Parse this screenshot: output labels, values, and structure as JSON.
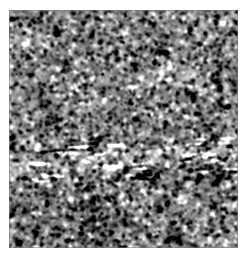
{
  "figure": {
    "kind": "grayscale-histopathology-micrograph",
    "title": "",
    "caption": "",
    "colorspace": "grayscale",
    "canvas": {
      "width_px": 247,
      "height_px": 258,
      "background_color": "#ffffff"
    },
    "panel": {
      "left_px": 9,
      "top_px": 10,
      "width_px": 229,
      "height_px": 238,
      "border_color": "#787878",
      "mean_gray": "#8d8d8d",
      "min_gray": "#0f0f0f",
      "max_gray": "#ffffff"
    },
    "texture": {
      "description": "dense cellular tissue, small dark nuclei on mid-gray cytoplasmic background",
      "nucleus_diameter_px": 3,
      "nucleus_color": "#1e1e1e",
      "highlight_color": "#f2f2f2",
      "background_color": "#8a8a8a",
      "grain_scale_px": 2,
      "seed": 20240517
    },
    "features": [
      {
        "name": "horizontal-stromal-band",
        "description": "lighter fibrous / vascular band crossing the field horizontally",
        "center_y_px": 148,
        "thickness_px": 26,
        "tilt_deg": -2,
        "brightness_delta": 26
      },
      {
        "name": "band-dark-rim",
        "description": "darker condensed margin along the upper edge of the band",
        "center_y_px": 134,
        "thickness_px": 7,
        "brightness_delta": -22
      },
      {
        "name": "dark-cell-cluster-lower-left",
        "description": "dark hypercellular cluster in the lower left quadrant",
        "center_x_px": 88,
        "center_y_px": 208,
        "radius_px": 26,
        "brightness_delta": -30
      },
      {
        "name": "pale-zone-upper-right",
        "description": "slightly paler region in the upper right quadrant",
        "center_x_px": 180,
        "center_y_px": 62,
        "radius_px": 52,
        "brightness_delta": 10
      },
      {
        "name": "pale-zone-mid-left",
        "description": "pale streak entering from the left edge toward the band",
        "center_x_px": 24,
        "center_y_px": 158,
        "radius_px": 30,
        "brightness_delta": 12
      }
    ],
    "labels": {
      "scale_bar": "",
      "annotation": ""
    }
  }
}
